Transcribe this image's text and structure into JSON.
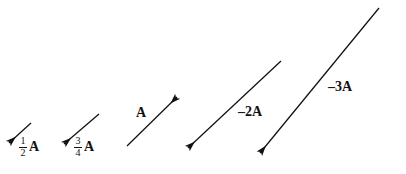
{
  "figure": {
    "background_color": "#ffffff",
    "ink_color": "#111111",
    "width": 406,
    "height": 174
  },
  "vectors": [
    {
      "id": "half-a",
      "label_text": "1/2 A",
      "numerator": "1",
      "denominator": "2",
      "symbol": "A",
      "scalar": 0.5,
      "direction": "down-left",
      "tail_x": 31,
      "tail_y": 123,
      "tip_x": 9,
      "tip_y": 143,
      "label_x": 19,
      "label_y": 136
    },
    {
      "id": "three-quarter-a",
      "label_text": "3/4 A",
      "numerator": "3",
      "denominator": "4",
      "symbol": "A",
      "scalar": 0.75,
      "direction": "down-left",
      "tail_x": 99,
      "tail_y": 114,
      "tip_x": 64,
      "tip_y": 144,
      "label_x": 74,
      "label_y": 136
    },
    {
      "id": "a",
      "label_text": "A",
      "scalar": 1,
      "direction": "up-right",
      "tail_x": 127,
      "tail_y": 146,
      "tip_x": 177,
      "tip_y": 97,
      "label_x": 136,
      "label_y": 106
    },
    {
      "id": "minus-two-a",
      "label_text": "–2A",
      "scalar": -2,
      "direction": "down-left",
      "tail_x": 281,
      "tail_y": 61,
      "tip_x": 188,
      "tip_y": 148,
      "label_x": 238,
      "label_y": 105
    },
    {
      "id": "minus-three-a",
      "label_text": "–3A",
      "scalar": -3,
      "direction": "down-left",
      "tail_x": 379,
      "tail_y": 8,
      "tip_x": 260,
      "tip_y": 153,
      "label_x": 328,
      "label_y": 80
    }
  ]
}
